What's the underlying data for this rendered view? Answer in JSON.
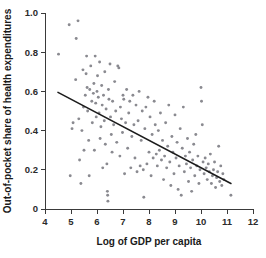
{
  "chart_data": {
    "type": "scatter",
    "title": "",
    "xlabel": "Log of GDP per capita",
    "ylabel": "Out-of-pocket share of health expenditures",
    "xlim": [
      4,
      12
    ],
    "ylim": [
      0,
      1.0
    ],
    "xticks": [
      "4",
      "5",
      "6",
      "7",
      "8",
      "9",
      "10",
      "11",
      "12"
    ],
    "xtick_values": [
      4,
      5,
      6,
      7,
      8,
      9,
      10,
      11,
      12
    ],
    "yticks": [
      "0",
      "0.2",
      "0.4",
      "0.6",
      "0.8",
      "1.0"
    ],
    "ytick_values": [
      0,
      0.2,
      0.4,
      0.6,
      0.8,
      1.0
    ],
    "grid": false,
    "legend": null,
    "point_color": "#8a8a90",
    "line_color": "#1c1c1c",
    "axis_color": "#3a3a3a",
    "trend_line": {
      "label": "fitted regression line",
      "x_start": 4.5,
      "y_start": 0.595,
      "x_end": 11.15,
      "y_end": 0.13
    },
    "points": [
      [
        4.52,
        0.79
      ],
      [
        4.93,
        0.94
      ],
      [
        4.97,
        0.17
      ],
      [
        5.04,
        0.41
      ],
      [
        5.08,
        0.44
      ],
      [
        5.18,
        0.66
      ],
      [
        5.2,
        0.87
      ],
      [
        5.27,
        0.96
      ],
      [
        5.3,
        0.46
      ],
      [
        5.33,
        0.25
      ],
      [
        5.38,
        0.13
      ],
      [
        5.42,
        0.4
      ],
      [
        5.46,
        0.71
      ],
      [
        5.48,
        0.52
      ],
      [
        5.5,
        0.3
      ],
      [
        5.55,
        0.58
      ],
      [
        5.58,
        0.69
      ],
      [
        5.6,
        0.78
      ],
      [
        5.62,
        0.62
      ],
      [
        5.64,
        0.5
      ],
      [
        5.68,
        0.35
      ],
      [
        5.7,
        0.17
      ],
      [
        5.72,
        0.61
      ],
      [
        5.76,
        0.73
      ],
      [
        5.8,
        0.55
      ],
      [
        5.82,
        0.44
      ],
      [
        5.86,
        0.59
      ],
      [
        5.88,
        0.64
      ],
      [
        5.9,
        0.3
      ],
      [
        5.93,
        0.78
      ],
      [
        5.95,
        0.54
      ],
      [
        5.97,
        0.47
      ],
      [
        6.0,
        0.6
      ],
      [
        6.02,
        0.68
      ],
      [
        6.05,
        0.57
      ],
      [
        6.08,
        0.49
      ],
      [
        6.1,
        0.75
      ],
      [
        6.12,
        0.36
      ],
      [
        6.15,
        0.42
      ],
      [
        6.18,
        0.63
      ],
      [
        6.2,
        0.53
      ],
      [
        6.22,
        0.21
      ],
      [
        6.25,
        0.58
      ],
      [
        6.28,
        0.45
      ],
      [
        6.3,
        0.7
      ],
      [
        6.32,
        0.33
      ],
      [
        6.35,
        0.51
      ],
      [
        6.38,
        0.23
      ],
      [
        6.4,
        0.09
      ],
      [
        6.41,
        0.07
      ],
      [
        6.42,
        0.04
      ],
      [
        6.44,
        0.61
      ],
      [
        6.46,
        0.56
      ],
      [
        6.5,
        0.74
      ],
      [
        6.52,
        0.47
      ],
      [
        6.55,
        0.38
      ],
      [
        6.58,
        0.29
      ],
      [
        6.6,
        0.55
      ],
      [
        6.64,
        0.43
      ],
      [
        6.68,
        0.65
      ],
      [
        6.72,
        0.5
      ],
      [
        6.76,
        0.34
      ],
      [
        6.8,
        0.73
      ],
      [
        6.84,
        0.72
      ],
      [
        6.88,
        0.27
      ],
      [
        6.9,
        0.52
      ],
      [
        6.94,
        0.46
      ],
      [
        6.98,
        0.39
      ],
      [
        7.0,
        0.58
      ],
      [
        7.03,
        0.56
      ],
      [
        7.06,
        0.18
      ],
      [
        7.1,
        0.44
      ],
      [
        7.14,
        0.61
      ],
      [
        7.18,
        0.31
      ],
      [
        7.22,
        0.49
      ],
      [
        7.26,
        0.55
      ],
      [
        7.3,
        0.21
      ],
      [
        7.34,
        0.37
      ],
      [
        7.38,
        0.58
      ],
      [
        7.42,
        0.43
      ],
      [
        7.46,
        0.26
      ],
      [
        7.5,
        0.53
      ],
      [
        7.54,
        0.19
      ],
      [
        7.58,
        0.45
      ],
      [
        7.62,
        0.6
      ],
      [
        7.66,
        0.22
      ],
      [
        7.7,
        0.35
      ],
      [
        7.74,
        0.5
      ],
      [
        7.78,
        0.2
      ],
      [
        7.8,
        0.06
      ],
      [
        7.84,
        0.41
      ],
      [
        7.88,
        0.52
      ],
      [
        7.92,
        0.23
      ],
      [
        7.96,
        0.57
      ],
      [
        8.0,
        0.29
      ],
      [
        8.04,
        0.47
      ],
      [
        8.08,
        0.17
      ],
      [
        8.12,
        0.38
      ],
      [
        8.16,
        0.26
      ],
      [
        8.2,
        0.55
      ],
      [
        8.24,
        0.43
      ],
      [
        8.28,
        0.28
      ],
      [
        8.32,
        0.22
      ],
      [
        8.36,
        0.4
      ],
      [
        8.4,
        0.3
      ],
      [
        8.44,
        0.49
      ],
      [
        8.48,
        0.25
      ],
      [
        8.52,
        0.35
      ],
      [
        8.56,
        0.15
      ],
      [
        8.6,
        0.27
      ],
      [
        8.64,
        0.44
      ],
      [
        8.68,
        0.21
      ],
      [
        8.72,
        0.32
      ],
      [
        8.76,
        0.53
      ],
      [
        8.8,
        0.24
      ],
      [
        8.84,
        0.12
      ],
      [
        8.88,
        0.37
      ],
      [
        8.92,
        0.29
      ],
      [
        8.96,
        0.18
      ],
      [
        9.0,
        0.48
      ],
      [
        9.04,
        0.26
      ],
      [
        9.08,
        0.34
      ],
      [
        9.12,
        0.1
      ],
      [
        9.16,
        0.22
      ],
      [
        9.2,
        0.41
      ],
      [
        9.24,
        0.07
      ],
      [
        9.28,
        0.31
      ],
      [
        9.32,
        0.52
      ],
      [
        9.36,
        0.19
      ],
      [
        9.4,
        0.27
      ],
      [
        9.44,
        0.23
      ],
      [
        9.48,
        0.36
      ],
      [
        9.52,
        0.14
      ],
      [
        9.56,
        0.29
      ],
      [
        9.6,
        0.21
      ],
      [
        9.64,
        0.09
      ],
      [
        9.68,
        0.25
      ],
      [
        9.72,
        0.33
      ],
      [
        9.76,
        0.17
      ],
      [
        9.8,
        0.38
      ],
      [
        9.84,
        0.22
      ],
      [
        9.88,
        0.27
      ],
      [
        9.92,
        0.13
      ],
      [
        9.96,
        0.2
      ],
      [
        10.0,
        0.62
      ],
      [
        10.02,
        0.55
      ],
      [
        10.05,
        0.43
      ],
      [
        10.08,
        0.24
      ],
      [
        10.12,
        0.18
      ],
      [
        10.16,
        0.26
      ],
      [
        10.2,
        0.21
      ],
      [
        10.24,
        0.15
      ],
      [
        10.28,
        0.23
      ],
      [
        10.32,
        0.19
      ],
      [
        10.36,
        0.28
      ],
      [
        10.4,
        0.13
      ],
      [
        10.44,
        0.17
      ],
      [
        10.48,
        0.2
      ],
      [
        10.52,
        0.24
      ],
      [
        10.56,
        0.11
      ],
      [
        10.6,
        0.16
      ],
      [
        10.64,
        0.19
      ],
      [
        10.68,
        0.32
      ],
      [
        10.72,
        0.14
      ],
      [
        10.76,
        0.22
      ],
      [
        10.8,
        0.12
      ],
      [
        10.84,
        0.18
      ],
      [
        10.88,
        0.15
      ],
      [
        11.15,
        0.07
      ]
    ]
  }
}
